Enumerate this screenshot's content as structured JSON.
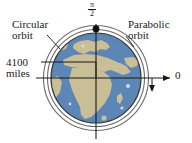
{
  "figure": {
    "kind": "orbit-diagram",
    "background_color": "#ffffff"
  },
  "labels": {
    "circular_orbit_line1": "Circular",
    "circular_orbit_line2": "orbit",
    "parabolic_orbit_line1": "Parabolic",
    "parabolic_orbit_line2": "orbit",
    "radius_line1": "4100",
    "radius_line2": "miles",
    "angle_top_numerator": "π",
    "angle_top_denominator": "2",
    "angle_right": "0"
  },
  "globe": {
    "ocean_color": "#5b86b5",
    "land_color": "#c9be96",
    "outline_color": "#3a3a3a",
    "center_x": 96,
    "center_y": 78,
    "radius": 45
  },
  "orbits": [
    {
      "name": "circular-orbit",
      "radius": 48.5,
      "color": "#6b6b6b"
    },
    {
      "name": "parabolic-orbit",
      "radius": 52.5,
      "color": "#6b6b6b"
    }
  ],
  "axes": {
    "color": "#1a1a1a",
    "vertical_label": "π/2",
    "horizontal_label": "0"
  },
  "satellite_marker": {
    "color": "#111111",
    "x": 96,
    "y": 29,
    "radius": 3.4
  }
}
